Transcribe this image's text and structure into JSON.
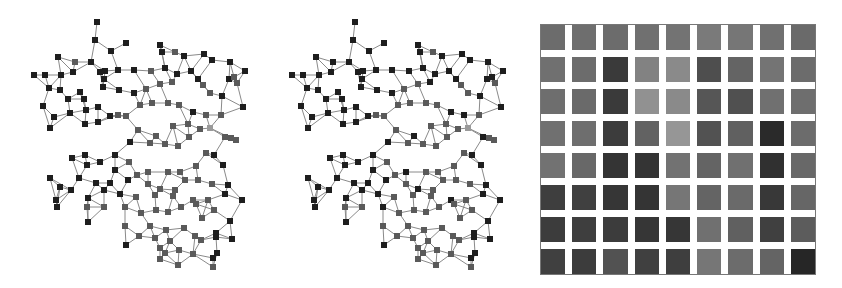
{
  "figure": {
    "panels": [
      {
        "id": "network-left",
        "type": "network-graph",
        "node_shape": "square"
      },
      {
        "id": "network-middle",
        "type": "network-graph",
        "node_shape": "square"
      },
      {
        "id": "heatmap",
        "type": "grid-matrix",
        "rows": 8,
        "cols": 9
      }
    ]
  },
  "colors": {
    "edge": "#8a8a8a",
    "node_dark": "#1e1e1e",
    "node_mid": "#5a5a5a",
    "node_light": "#9a9a9a",
    "grid_gap": "#ffffff"
  },
  "network": {
    "nodes": [
      [
        97,
        22,
        0
      ],
      [
        95,
        40,
        0
      ],
      [
        58,
        57,
        0
      ],
      [
        75,
        62,
        1
      ],
      [
        111,
        51,
        0
      ],
      [
        126,
        43,
        0
      ],
      [
        160,
        45,
        0
      ],
      [
        34,
        75,
        0
      ],
      [
        45,
        75,
        0
      ],
      [
        61,
        75,
        0
      ],
      [
        73,
        72,
        0
      ],
      [
        91,
        62,
        0
      ],
      [
        100,
        72,
        0
      ],
      [
        104,
        79,
        0
      ],
      [
        105,
        71,
        0
      ],
      [
        118,
        70,
        0
      ],
      [
        134,
        70,
        0
      ],
      [
        151,
        71,
        1
      ],
      [
        162,
        52,
        0
      ],
      [
        175,
        52,
        1
      ],
      [
        165,
        68,
        0
      ],
      [
        184,
        56,
        0
      ],
      [
        204,
        54,
        0
      ],
      [
        212,
        60,
        0
      ],
      [
        230,
        62,
        0
      ],
      [
        229,
        79,
        0
      ],
      [
        237,
        83,
        1
      ],
      [
        245,
        71,
        0
      ],
      [
        49,
        88,
        0
      ],
      [
        60,
        90,
        0
      ],
      [
        80,
        92,
        0
      ],
      [
        68,
        99,
        0
      ],
      [
        84,
        99,
        0
      ],
      [
        103,
        87,
        0
      ],
      [
        119,
        90,
        0
      ],
      [
        134,
        93,
        0
      ],
      [
        146,
        89,
        1
      ],
      [
        160,
        84,
        1
      ],
      [
        172,
        82,
        1
      ],
      [
        177,
        74,
        0
      ],
      [
        191,
        71,
        0
      ],
      [
        198,
        79,
        0
      ],
      [
        203,
        85,
        1
      ],
      [
        210,
        93,
        1
      ],
      [
        222,
        96,
        0
      ],
      [
        234,
        77,
        1
      ],
      [
        243,
        107,
        0
      ],
      [
        43,
        106,
        0
      ],
      [
        54,
        117,
        0
      ],
      [
        70,
        113,
        0
      ],
      [
        86,
        110,
        0
      ],
      [
        98,
        107,
        0
      ],
      [
        110,
        116,
        0
      ],
      [
        126,
        116,
        1
      ],
      [
        140,
        105,
        1
      ],
      [
        152,
        103,
        1
      ],
      [
        168,
        103,
        1
      ],
      [
        179,
        105,
        1
      ],
      [
        193,
        112,
        0
      ],
      [
        206,
        115,
        1
      ],
      [
        221,
        115,
        1
      ],
      [
        50,
        128,
        0
      ],
      [
        85,
        124,
        0
      ],
      [
        98,
        122,
        0
      ],
      [
        118,
        115,
        1
      ],
      [
        138,
        130,
        1
      ],
      [
        156,
        136,
        1
      ],
      [
        173,
        126,
        1
      ],
      [
        188,
        124,
        1
      ],
      [
        200,
        129,
        1
      ],
      [
        210,
        128,
        2
      ],
      [
        231,
        138,
        1
      ],
      [
        85,
        155,
        0
      ],
      [
        115,
        155,
        0
      ],
      [
        130,
        142,
        0
      ],
      [
        150,
        143,
        1
      ],
      [
        165,
        144,
        1
      ],
      [
        178,
        146,
        1
      ],
      [
        189,
        137,
        1
      ],
      [
        206,
        153,
        1
      ],
      [
        225,
        137,
        1
      ],
      [
        236,
        140,
        1
      ],
      [
        72,
        158,
        0
      ],
      [
        87,
        165,
        0
      ],
      [
        100,
        162,
        0
      ],
      [
        115,
        170,
        0
      ],
      [
        129,
        162,
        1
      ],
      [
        148,
        172,
        1
      ],
      [
        168,
        172,
        1
      ],
      [
        180,
        172,
        1
      ],
      [
        196,
        166,
        1
      ],
      [
        214,
        155,
        0
      ],
      [
        223,
        165,
        0
      ],
      [
        50,
        178,
        0
      ],
      [
        60,
        187,
        0
      ],
      [
        79,
        178,
        0
      ],
      [
        96,
        183,
        0
      ],
      [
        110,
        183,
        0
      ],
      [
        128,
        180,
        0
      ],
      [
        137,
        175,
        1
      ],
      [
        148,
        184,
        1
      ],
      [
        160,
        189,
        1
      ],
      [
        175,
        190,
        1
      ],
      [
        185,
        180,
        1
      ],
      [
        198,
        180,
        1
      ],
      [
        212,
        184,
        1
      ],
      [
        228,
        185,
        0
      ],
      [
        56,
        200,
        0
      ],
      [
        71,
        190,
        0
      ],
      [
        88,
        198,
        0
      ],
      [
        104,
        190,
        0
      ],
      [
        120,
        194,
        0
      ],
      [
        136,
        197,
        1
      ],
      [
        155,
        195,
        1
      ],
      [
        173,
        196,
        1
      ],
      [
        193,
        200,
        1
      ],
      [
        208,
        200,
        1
      ],
      [
        225,
        194,
        0
      ],
      [
        242,
        200,
        0
      ],
      [
        57,
        207,
        0
      ],
      [
        87,
        207,
        1
      ],
      [
        104,
        207,
        1
      ],
      [
        125,
        207,
        1
      ],
      [
        141,
        213,
        1
      ],
      [
        156,
        210,
        1
      ],
      [
        168,
        212,
        1
      ],
      [
        181,
        207,
        1
      ],
      [
        196,
        204,
        1
      ],
      [
        214,
        210,
        1
      ],
      [
        230,
        221,
        0
      ],
      [
        88,
        222,
        0
      ],
      [
        125,
        226,
        1
      ],
      [
        150,
        226,
        1
      ],
      [
        166,
        230,
        1
      ],
      [
        184,
        228,
        1
      ],
      [
        202,
        218,
        1
      ],
      [
        216,
        233,
        0
      ],
      [
        139,
        236,
        1
      ],
      [
        155,
        238,
        1
      ],
      [
        170,
        241,
        1
      ],
      [
        195,
        236,
        1
      ],
      [
        216,
        237,
        0
      ],
      [
        232,
        239,
        0
      ],
      [
        126,
        245,
        0
      ],
      [
        160,
        248,
        1
      ],
      [
        179,
        250,
        1
      ],
      [
        201,
        240,
        1
      ],
      [
        217,
        253,
        0
      ],
      [
        165,
        253,
        1
      ],
      [
        193,
        254,
        1
      ],
      [
        213,
        258,
        0
      ],
      [
        213,
        267,
        1
      ],
      [
        160,
        259,
        1
      ],
      [
        178,
        265,
        1
      ]
    ],
    "edges_k_nearest": 3
  },
  "heatmap": {
    "cells": [
      [
        108,
        110,
        108,
        112,
        115,
        122,
        118,
        112,
        106
      ],
      [
        112,
        108,
        58,
        130,
        138,
        78,
        100,
        116,
        108
      ],
      [
        110,
        106,
        58,
        145,
        138,
        86,
        80,
        112,
        110
      ],
      [
        112,
        110,
        60,
        98,
        150,
        82,
        96,
        42,
        108
      ],
      [
        114,
        104,
        52,
        52,
        114,
        100,
        112,
        48,
        104
      ],
      [
        62,
        64,
        54,
        52,
        118,
        100,
        106,
        56,
        102
      ],
      [
        60,
        62,
        60,
        54,
        54,
        112,
        96,
        64,
        92
      ],
      [
        64,
        60,
        82,
        64,
        62,
        118,
        108,
        100,
        38
      ]
    ]
  }
}
